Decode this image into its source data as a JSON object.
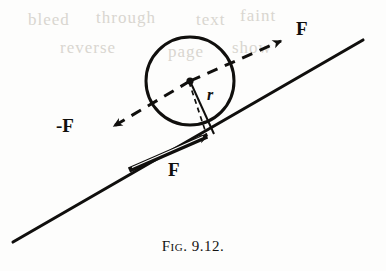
{
  "figure": {
    "caption_prefix": "Fig.",
    "caption_number": "9.12.",
    "caption_full": "FIG. 9.12.",
    "background_color": "#fdfdfc",
    "ink_color": "#100f0d"
  },
  "labels": {
    "force_up_right": "F",
    "force_down_left": "-F",
    "force_friction": "F",
    "radius": "r"
  },
  "geometry": {
    "circle": {
      "center_x": 190,
      "center_y": 81,
      "radius": 44
    },
    "incline": {
      "x1": 13,
      "y1": 242,
      "x2": 363,
      "y2": 40
    },
    "contact_point": {
      "x": 213,
      "y": 133
    },
    "dashed_force_line": {
      "x1": 106,
      "y1": 130,
      "x2": 287,
      "y2": 37
    },
    "friction_arrow": {
      "x1": 129,
      "y1": 170,
      "x2": 212,
      "y2": 134
    }
  },
  "ghosting": [
    {
      "text": "bleed",
      "x": 28,
      "y": 10
    },
    {
      "text": "through",
      "x": 96,
      "y": 8
    },
    {
      "text": "text",
      "x": 196,
      "y": 10
    },
    {
      "text": "faint",
      "x": 240,
      "y": 6
    },
    {
      "text": "reverse",
      "x": 60,
      "y": 40
    },
    {
      "text": "page",
      "x": 168,
      "y": 44
    },
    {
      "text": "show",
      "x": 232,
      "y": 40
    }
  ]
}
